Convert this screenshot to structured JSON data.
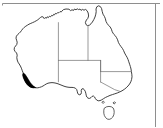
{
  "figure": {
    "kind": "map",
    "width": 163,
    "height": 128,
    "background_color": "#ffffff"
  },
  "frame": {
    "visible": true,
    "color": "#8e8e8e",
    "edges": [
      "top",
      "right"
    ]
  },
  "styles": {
    "coastline_color": "#2b2b2b",
    "state_border_color": "#6f6f6f",
    "land_fill_color": "#ffffff",
    "highlight_fill_color": "#000000",
    "island_outline_color": "#3a3a3a"
  },
  "regions": [
    {
      "name": "mainland-australia",
      "role": "landmass-outline",
      "fill": "#ffffff",
      "stroke": "#2b2b2b"
    },
    {
      "name": "tasmania",
      "role": "island-outline",
      "fill": "#ffffff",
      "stroke": "#3a3a3a"
    },
    {
      "name": "southwest-highlight",
      "role": "shaded-distribution-area",
      "fill": "#000000",
      "stroke": "#000000"
    }
  ],
  "internal_boundaries": [
    {
      "name": "wa-nt-sa-western-meridian",
      "orientation": "vertical"
    },
    {
      "name": "nt-qld-eastern-meridian",
      "orientation": "vertical"
    },
    {
      "name": "nt-sa-parallel",
      "orientation": "horizontal"
    },
    {
      "name": "sa-nsw-qld-parallel",
      "orientation": "horizontal"
    },
    {
      "name": "nsw-vic-boundary",
      "orientation": "diagonal"
    },
    {
      "name": "qld-nsw-boundary",
      "orientation": "horizontal"
    }
  ]
}
